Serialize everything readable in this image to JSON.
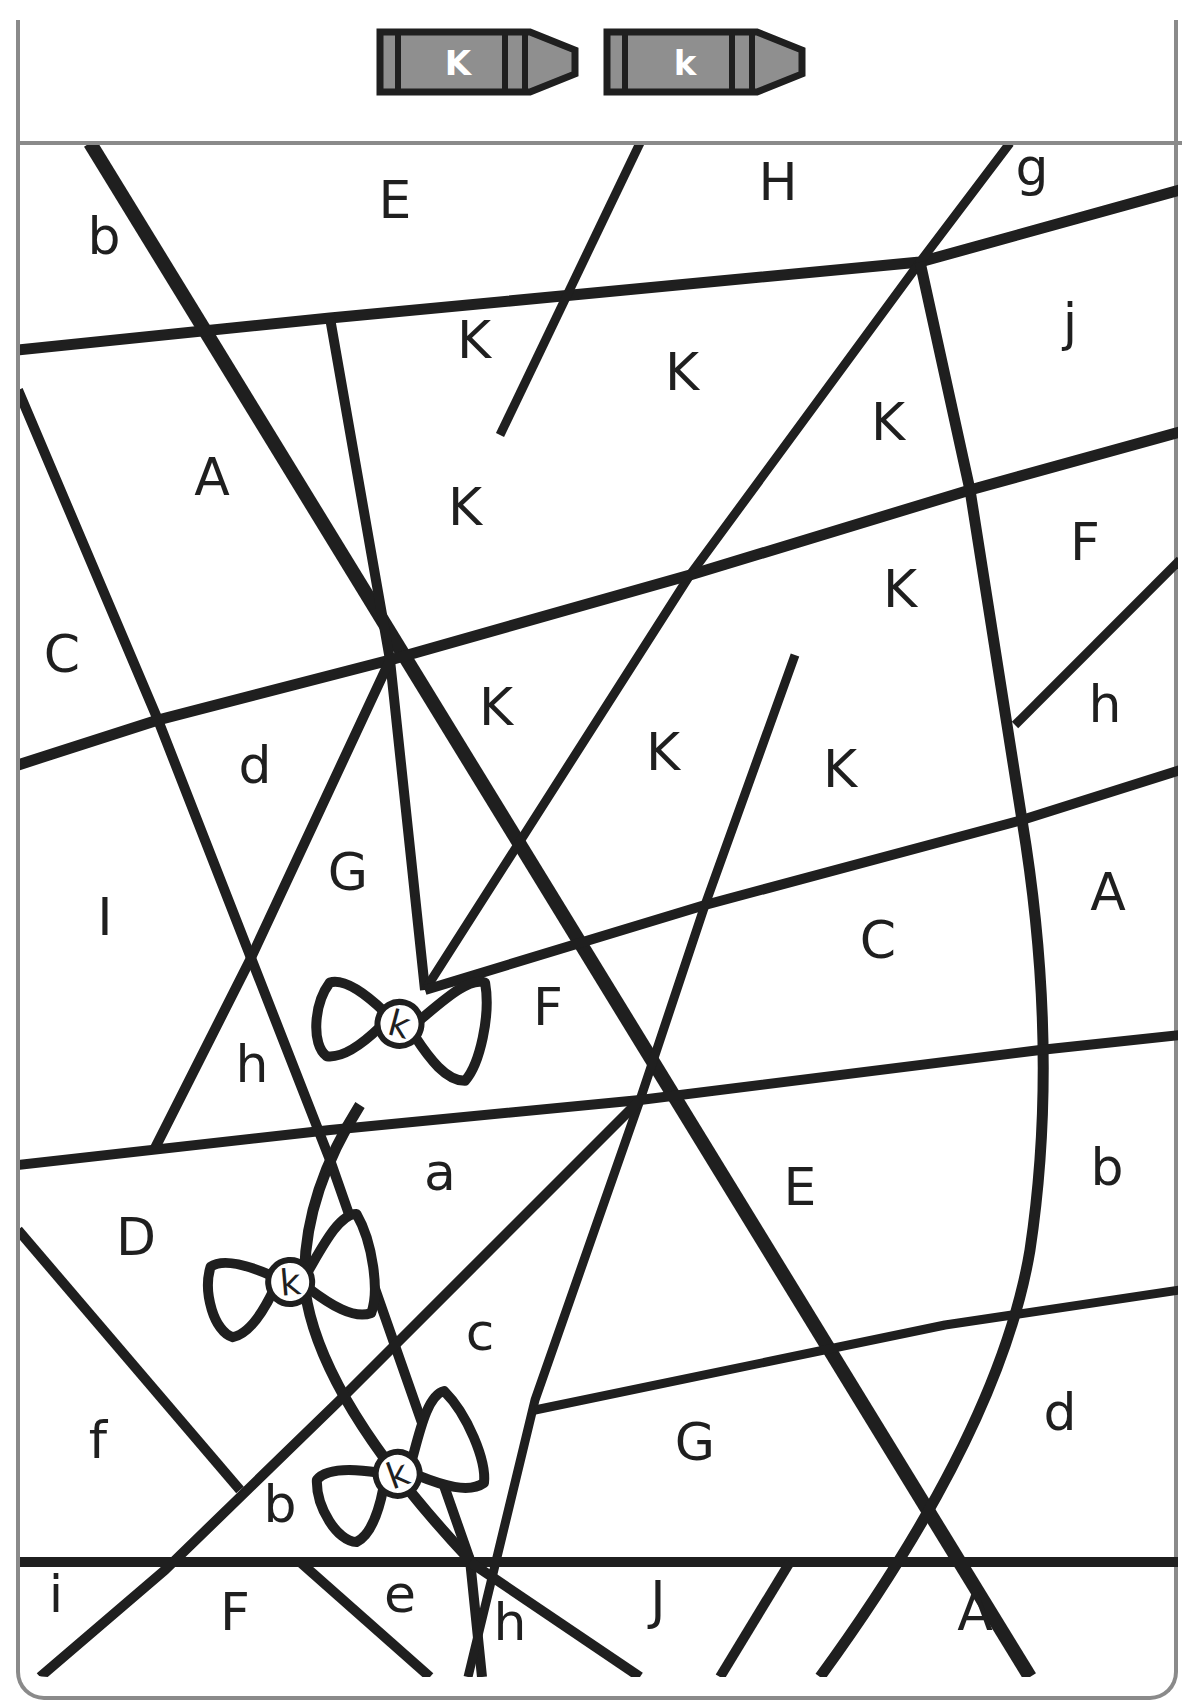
{
  "worksheet": {
    "title": "Color by Letter K",
    "watermark": "",
    "colors": {
      "ink": "#1f1f1f",
      "frame": "#8a8a8a",
      "crayon_fill": "#8f8f8f",
      "crayon_outline": "#1f1f1f",
      "paper": "#ffffff"
    }
  },
  "legend": {
    "crayons": [
      {
        "letter": "K",
        "x": 380,
        "y": 32
      },
      {
        "letter": "k",
        "x": 607,
        "y": 32
      }
    ]
  },
  "regions": [
    {
      "letter": "b",
      "x": 104,
      "y": 254
    },
    {
      "letter": "E",
      "x": 395,
      "y": 218
    },
    {
      "letter": "H",
      "x": 778,
      "y": 200
    },
    {
      "letter": "g",
      "x": 1032,
      "y": 185
    },
    {
      "letter": "j",
      "x": 1070,
      "y": 340
    },
    {
      "letter": "K",
      "x": 474,
      "y": 358
    },
    {
      "letter": "K",
      "x": 682,
      "y": 390
    },
    {
      "letter": "K",
      "x": 888,
      "y": 440
    },
    {
      "letter": "A",
      "x": 212,
      "y": 495
    },
    {
      "letter": "K",
      "x": 465,
      "y": 525
    },
    {
      "letter": "F",
      "x": 1085,
      "y": 560
    },
    {
      "letter": "K",
      "x": 900,
      "y": 607
    },
    {
      "letter": "C",
      "x": 62,
      "y": 672
    },
    {
      "letter": "h",
      "x": 1105,
      "y": 722
    },
    {
      "letter": "K",
      "x": 496,
      "y": 725
    },
    {
      "letter": "d",
      "x": 255,
      "y": 783
    },
    {
      "letter": "K",
      "x": 663,
      "y": 770
    },
    {
      "letter": "K",
      "x": 840,
      "y": 787
    },
    {
      "letter": "G",
      "x": 348,
      "y": 890
    },
    {
      "letter": "A",
      "x": 1108,
      "y": 910
    },
    {
      "letter": "I",
      "x": 105,
      "y": 935
    },
    {
      "letter": "C",
      "x": 878,
      "y": 958
    },
    {
      "letter": "F",
      "x": 548,
      "y": 1025
    },
    {
      "letter": "h",
      "x": 252,
      "y": 1082
    },
    {
      "letter": "a",
      "x": 440,
      "y": 1190
    },
    {
      "letter": "b",
      "x": 1107,
      "y": 1185
    },
    {
      "letter": "E",
      "x": 800,
      "y": 1205
    },
    {
      "letter": "D",
      "x": 136,
      "y": 1255
    },
    {
      "letter": "c",
      "x": 480,
      "y": 1350
    },
    {
      "letter": "d",
      "x": 1060,
      "y": 1430
    },
    {
      "letter": "G",
      "x": 695,
      "y": 1460
    },
    {
      "letter": "f",
      "x": 98,
      "y": 1458
    },
    {
      "letter": "b",
      "x": 280,
      "y": 1522
    },
    {
      "letter": "i",
      "x": 56,
      "y": 1612
    },
    {
      "letter": "F",
      "x": 235,
      "y": 1630
    },
    {
      "letter": "e",
      "x": 400,
      "y": 1612
    },
    {
      "letter": "h",
      "x": 510,
      "y": 1640
    },
    {
      "letter": "J",
      "x": 658,
      "y": 1618
    },
    {
      "letter": "A",
      "x": 975,
      "y": 1630
    }
  ],
  "bows": [
    {
      "letter": "k",
      "x": 400,
      "y": 1022,
      "rotate": 15
    },
    {
      "letter": "k",
      "x": 290,
      "y": 1280,
      "rotate": -5
    },
    {
      "letter": "k",
      "x": 397,
      "y": 1472,
      "rotate": -20
    }
  ],
  "lines": [
    {
      "d": "M90,143 L1030,1677",
      "w": 14
    },
    {
      "d": "M18,350 L330,318 L920,262 L1180,190",
      "w": 11
    },
    {
      "d": "M18,390 L158,720 L330,1160 L470,1560 L482,1677",
      "w": 10
    },
    {
      "d": "M330,318 L390,660 L425,990",
      "w": 10
    },
    {
      "d": "M640,143 L500,435",
      "w": 9
    },
    {
      "d": "M1010,143 L920,262 L690,575 L425,990",
      "w": 9
    },
    {
      "d": "M920,262 L970,490 L1022,820 Q1060,1050 1030,1250 Q1000,1430 820,1677",
      "w": 11
    },
    {
      "d": "M18,765 L158,720 L390,660 L690,575 L970,490 L1180,432",
      "w": 11
    },
    {
      "d": "M390,660 L250,960 L155,1148",
      "w": 10
    },
    {
      "d": "M1180,560 L1015,725",
      "w": 9
    },
    {
      "d": "M425,990 L705,905 L1022,820 L1180,770",
      "w": 10
    },
    {
      "d": "M795,655 L705,905 L640,1100 L535,1400 L468,1677",
      "w": 9
    },
    {
      "d": "M18,1165 L330,1130 L640,1100 L1040,1050 L1180,1035",
      "w": 10
    },
    {
      "d": "M640,1100 L340,1400 L165,1570 L40,1677",
      "w": 10
    },
    {
      "d": "M18,1230 L240,1490",
      "w": 10
    },
    {
      "d": "M535,1410 L945,1325 L1180,1290",
      "w": 9
    },
    {
      "d": "M18,1562 L1180,1562",
      "w": 10
    },
    {
      "d": "M300,1562 L430,1677",
      "w": 10
    },
    {
      "d": "M470,1562 L640,1677",
      "w": 10
    },
    {
      "d": "M790,1562 L720,1677",
      "w": 10
    },
    {
      "d": "M360,1105 Q300,1200 305,1290 Q320,1400 470,1560",
      "w": 11
    }
  ]
}
